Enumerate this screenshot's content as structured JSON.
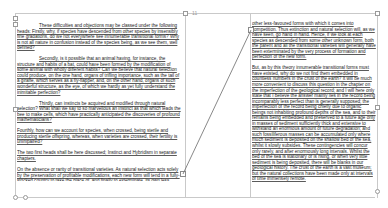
{
  "document": {
    "pages": [
      {
        "name": "left-page",
        "paragraphs": [
          {
            "indent": true,
            "text": "These difficulties and objections may be classed under the following heads: Firstly, why, if species have descended from other species by insensibly fine gradations, do we not everywhere see innumerable transitional forms? Why is not all nature in confusion instead of the species being, as we see them, well defined?"
          },
          {
            "indent": true,
            "text": "Secondly, is it possible that an animal having, for instance, the structure and habits of a bat, could have been formed by the modification of some animal with wholly different habits? Can we believe that natural selection could produce, on the one hand, organs of trifling importance, such as the tail of a giraffe, which serves as a fly-flapper, and, on the other hand, organs of such wonderful structure, as the eye, of which we hardly as yet fully understand the inimitable perfection?"
          },
          {
            "indent": true,
            "text": "Thirdly, can instincts be acquired and modified through natural selection? What shall we say to so marvellous an instinct as that which leads the bee to make cells, which have practically anticipated the discoveries of profound mathematicians?"
          },
          {
            "indent": false,
            "text": "Fourthly, how can we account for species, when crossed, being sterile and producing sterile offspring, whereas, when varieties are crossed, their fertility is unimpaired?"
          },
          {
            "indent": false,
            "text": "The two first heads shall be here discussed; Instinct and Hybridism in separate chapters."
          },
          {
            "indent": false,
            "text": "On the absence or rarity of transitional varieties. As natural selection acts solely by the preservation of profitable modifications, each new form will tend in a fully-stocked country to take the place of, and finally to exterminate, its own less improved parent or"
          }
        ]
      },
      {
        "name": "right-page",
        "paragraphs": [
          {
            "indent": false,
            "text": "other less-favoured forms with which it comes into competition. Thus extinction and natural selection will, as we have seen, go hand in hand. Hence, if we look at each species as descended from some other unknown form, both the parent and all the transitional varieties will generally have been exterminated by the very process of formation and perfection of the new form."
          },
          {
            "indent": false,
            "text": "But, as by this theory innumerable transitional forms must have existed, why do we not find them embedded in countless numbers in the crust of the earth? It will be much more convenient to discuss this question in the chapter on the imperfection of the geological record; and I will here only state that I believe the answer mainly lies in the record being incomparably less perfect than is generally supposed; the imperfection of the record being chiefly due to organic beings not inhabiting profound depths of the sea, and to their remains being embedded and preserved to a future age only in masses of sediment sufficiently thick and extensive to withstand an enormous amount of future degradation; and such fossiliferous masses can be accumulated only where much sediment is deposited on the shallow bed of the sea, whilst it slowly subsides. These contingencies will concur only rarely, and after enormously long intervals. Whilst the bed of the sea is stationary or is rising, or when very little sediment is being deposited, there will be blanks in our geological history. The crust of the earth is a vast museum; but the natural collections have been made only at intervals of time immensely remote."
          }
        ]
      }
    ]
  },
  "ui": {
    "left_page_marker": "11",
    "colors": {
      "frame_border": "#b4b4b4",
      "guide_line": "#c9c9c9",
      "connector": "#7a7a7a",
      "text": "#1a1a1a"
    }
  }
}
